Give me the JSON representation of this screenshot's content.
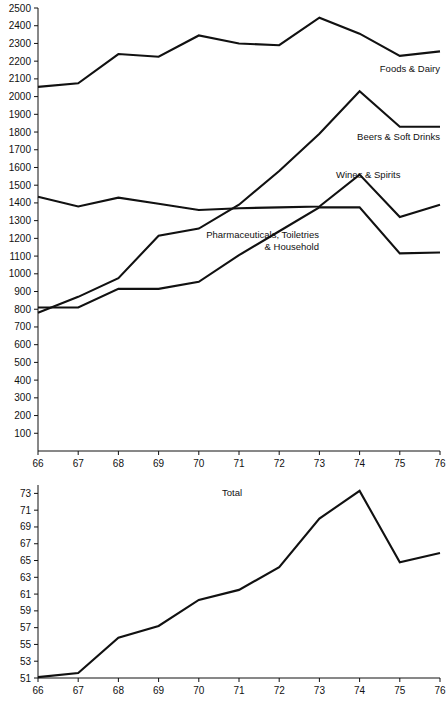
{
  "chart_data": [
    {
      "type": "line",
      "title": "",
      "xlabel": "",
      "ylabel": "",
      "x": [
        66,
        67,
        68,
        69,
        70,
        71,
        72,
        73,
        74,
        75,
        76
      ],
      "xlim": [
        66,
        76
      ],
      "ylim": [
        0,
        2500
      ],
      "grid": false,
      "legend_position": "inline-right",
      "xticks": [
        "66",
        "67",
        "68",
        "69",
        "70",
        "71",
        "72",
        "73",
        "74",
        "75",
        "76"
      ],
      "yticks": [
        "100",
        "200",
        "300",
        "400",
        "500",
        "600",
        "700",
        "800",
        "900",
        "1000",
        "1100",
        "1200",
        "1300",
        "1400",
        "1500",
        "1600",
        "1700",
        "1800",
        "1900",
        "2000",
        "2100",
        "2200",
        "2300",
        "2400",
        "2500"
      ],
      "series": [
        {
          "name": "Foods & Dairy",
          "values": [
            2055,
            2075,
            2240,
            2225,
            2345,
            2300,
            2290,
            2445,
            2355,
            2230,
            2255
          ]
        },
        {
          "name": "Beers & Soft Drinks",
          "values": [
            780,
            870,
            975,
            1215,
            1255,
            1390,
            1580,
            1790,
            2030,
            1830,
            1830
          ]
        },
        {
          "name": "Wines & Spirits",
          "values": [
            1435,
            1380,
            1430,
            1395,
            1360,
            1370,
            1375,
            1380,
            1560,
            1320,
            1390
          ]
        },
        {
          "name": "Pharmaceuticals, Toiletries & Household",
          "values": [
            810,
            810,
            915,
            915,
            955,
            1105,
            1240,
            1375,
            1375,
            1115,
            1120
          ]
        }
      ]
    },
    {
      "type": "line",
      "title": "Total",
      "xlabel": "",
      "ylabel": "",
      "x": [
        66,
        67,
        68,
        69,
        70,
        71,
        72,
        73,
        74,
        75,
        76
      ],
      "xlim": [
        66,
        76
      ],
      "ylim": [
        51,
        74
      ],
      "grid": false,
      "legend_position": "inline-top",
      "xticks": [
        "66",
        "67",
        "68",
        "69",
        "70",
        "71",
        "72",
        "73",
        "74",
        "75",
        "76"
      ],
      "yticks": [
        "51",
        "53",
        "55",
        "57",
        "59",
        "61",
        "63",
        "65",
        "67",
        "69",
        "71",
        "73"
      ],
      "series": [
        {
          "name": "Total",
          "values": [
            51.1,
            51.6,
            55.8,
            57.2,
            60.3,
            61.5,
            64.2,
            70.0,
            73.3,
            64.8,
            65.9
          ]
        }
      ]
    }
  ]
}
